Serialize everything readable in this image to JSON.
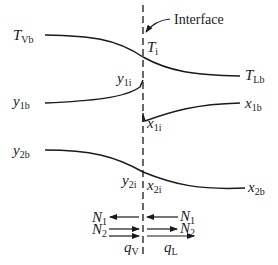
{
  "diagram": {
    "interface_label": "Interface",
    "labels": {
      "T_Vb": {
        "main": "T",
        "sub": "Vb"
      },
      "T_i": {
        "main": "T",
        "sub": "i"
      },
      "T_Lb": {
        "main": "T",
        "sub": "Lb"
      },
      "y_1b": {
        "main": "y",
        "sub": "1b"
      },
      "y_1i": {
        "main": "y",
        "sub": "1i"
      },
      "x_1b": {
        "main": "x",
        "sub": "1b"
      },
      "x_1i": {
        "main": "x",
        "sub": "1i"
      },
      "y_2b": {
        "main": "y",
        "sub": "2b"
      },
      "y_2i": {
        "main": "y",
        "sub": "2i"
      },
      "x_2i": {
        "main": "x",
        "sub": "2i"
      },
      "x_2b": {
        "main": "x",
        "sub": "2b"
      }
    },
    "fluxes": {
      "N1_left": {
        "main": "N",
        "sub": "1"
      },
      "N1_right": {
        "main": "N",
        "sub": "1"
      },
      "N2_left": {
        "main": "N",
        "sub": "2"
      },
      "N2_right": {
        "main": "N",
        "sub": "2"
      },
      "qV": {
        "main": "q",
        "sub": "V"
      },
      "qL": {
        "main": "q",
        "sub": "L"
      }
    }
  }
}
